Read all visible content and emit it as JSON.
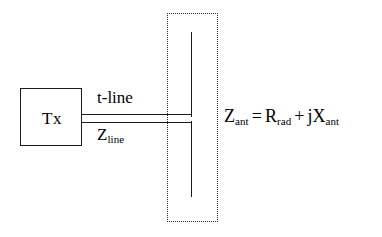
{
  "figure": {
    "background_color": "#ffffff",
    "line_color": "#1a1a1a",
    "dotted_border_color": "#2b2b2b"
  },
  "transmitter": {
    "label": "Tx"
  },
  "transmission_line": {
    "label_above": "t-line",
    "label_below_symbol": "Z",
    "label_below_subscript": "line"
  },
  "antenna": {
    "enclosure_style": "dotted",
    "element_type": "dipole"
  },
  "equation": {
    "lhs_symbol": "Z",
    "lhs_subscript": "ant",
    "equals": "=",
    "term1_symbol": "R",
    "term1_subscript": "rad",
    "plus": "+",
    "term2_symbol": "jX",
    "term2_subscript": "ant",
    "full_text": "Z_ant = R_rad + jX_ant"
  }
}
